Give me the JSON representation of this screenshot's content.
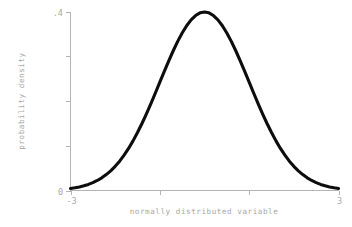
{
  "chart_data": {
    "type": "line",
    "title": "",
    "subtitle": "",
    "xlabel": "normally distributed variable",
    "ylabel": "probability density",
    "xlim": [
      -3,
      3
    ],
    "ylim": [
      0,
      0.4
    ],
    "grid": false,
    "legend": null,
    "legend_position": "none",
    "annotations": [],
    "x_ticks": [
      {
        "value": -3,
        "label": "-3",
        "labeled": true
      },
      {
        "value": -1,
        "label": "",
        "labeled": false
      },
      {
        "value": 1,
        "label": "",
        "labeled": false
      },
      {
        "value": 3,
        "label": "3",
        "labeled": true
      }
    ],
    "y_ticks": [
      {
        "value": 0.4,
        "label": ".4",
        "labeled": true
      },
      {
        "value": 0.3,
        "label": "",
        "labeled": false
      },
      {
        "value": 0.2,
        "label": "",
        "labeled": false
      },
      {
        "value": 0.1,
        "label": "",
        "labeled": false
      },
      {
        "value": 0,
        "label": "0",
        "labeled": true
      }
    ],
    "x_tick_labels": [
      "-3",
      "3"
    ],
    "y_tick_labels": [
      ".4",
      "0"
    ],
    "series": [
      {
        "name": "standard normal density",
        "color": "#0d0d0d",
        "line_width": 3,
        "x": [
          -3.0,
          -2.9,
          -2.8,
          -2.7,
          -2.6,
          -2.5,
          -2.4,
          -2.3,
          -2.2,
          -2.1,
          -2.0,
          -1.9,
          -1.8,
          -1.7,
          -1.6,
          -1.5,
          -1.4,
          -1.3,
          -1.2,
          -1.1,
          -1.0,
          -0.9,
          -0.8,
          -0.7,
          -0.6,
          -0.5,
          -0.4,
          -0.3,
          -0.2,
          -0.1,
          0.0,
          0.1,
          0.2,
          0.3,
          0.4,
          0.5,
          0.6,
          0.7,
          0.8,
          0.9,
          1.0,
          1.1,
          1.2,
          1.3,
          1.4,
          1.5,
          1.6,
          1.7,
          1.8,
          1.9,
          2.0,
          2.1,
          2.2,
          2.3,
          2.4,
          2.5,
          2.6,
          2.7,
          2.8,
          2.9,
          3.0
        ],
        "y": [
          0.0044,
          0.006,
          0.0079,
          0.0104,
          0.0136,
          0.0175,
          0.0224,
          0.0283,
          0.0355,
          0.044,
          0.054,
          0.0656,
          0.079,
          0.094,
          0.1109,
          0.1295,
          0.1497,
          0.1714,
          0.1942,
          0.2179,
          0.242,
          0.2661,
          0.2897,
          0.3123,
          0.3332,
          0.3521,
          0.3683,
          0.3814,
          0.391,
          0.397,
          0.3989,
          0.397,
          0.391,
          0.3814,
          0.3683,
          0.3521,
          0.3332,
          0.3123,
          0.2897,
          0.2661,
          0.242,
          0.2179,
          0.1942,
          0.1714,
          0.1497,
          0.1295,
          0.1109,
          0.094,
          0.079,
          0.0656,
          0.054,
          0.044,
          0.0355,
          0.0283,
          0.0224,
          0.0175,
          0.0136,
          0.0104,
          0.0079,
          0.006,
          0.0044
        ]
      }
    ],
    "distribution": {
      "family": "normal",
      "mean": 0,
      "sd": 1,
      "peak_value": 0.3989
    }
  },
  "colors": {
    "background": "#ffffff",
    "curve": "#0d0d0d",
    "axis": "#b4b4b4",
    "tick_label": "#aaaaaa",
    "axis_title": "#a8a8a8"
  }
}
